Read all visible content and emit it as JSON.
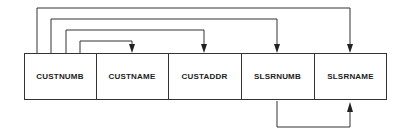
{
  "diagram": {
    "type": "functional-dependency",
    "fields": [
      {
        "label": "CUSTNUMB"
      },
      {
        "label": "CUSTNAME"
      },
      {
        "label": "CUSTADDR"
      },
      {
        "label": "SLSRNUMB"
      },
      {
        "label": "SLSRNAME"
      }
    ],
    "dependencies": [
      {
        "from": "CUSTNUMB",
        "to": "CUSTNAME"
      },
      {
        "from": "CUSTNUMB",
        "to": "CUSTADDR"
      },
      {
        "from": "CUSTNUMB",
        "to": "SLSRNUMB"
      },
      {
        "from": "CUSTNUMB",
        "to": "SLSRNAME"
      },
      {
        "from": "SLSRNUMB",
        "to": "SLSRNAME"
      }
    ]
  }
}
